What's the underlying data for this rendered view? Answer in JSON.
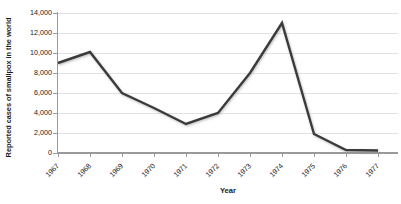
{
  "chart_data": {
    "type": "line",
    "title": "",
    "xlabel": "Year",
    "ylabel": "Reported cases of smallpox in the world",
    "categories": [
      "1967",
      "1968",
      "1969",
      "1970",
      "1971",
      "1972",
      "1973",
      "1974",
      "1975",
      "1976",
      "1977"
    ],
    "values": [
      9000,
      10100,
      6000,
      4500,
      2900,
      4000,
      8000,
      13000,
      1900,
      300,
      250
    ],
    "series": [
      {
        "name": "Reported cases of smallpox in the world",
        "values": [
          9000,
          10100,
          6000,
          4500,
          2900,
          4000,
          8000,
          13000,
          1900,
          300,
          250
        ]
      }
    ],
    "ylim": [
      0,
      14000
    ],
    "y_ticks": [
      0,
      2000,
      4000,
      6000,
      8000,
      10000,
      12000,
      14000
    ],
    "y_tick_labels": [
      "0",
      "2,000",
      "4,000",
      "6,000",
      "8,000",
      "10,000",
      "12,000",
      "14,000"
    ],
    "grid": true,
    "legend": false,
    "line_color": "#3a3a3a",
    "gridline_color": "#e2e2e2",
    "axis_color": "#9a9a9a",
    "background_color": "#ffffff"
  }
}
